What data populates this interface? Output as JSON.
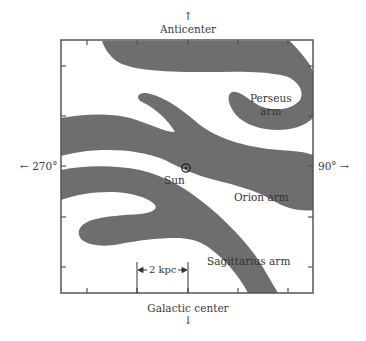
{
  "diagram": {
    "directions": {
      "top": {
        "arrow": "↑",
        "label": "Anticenter"
      },
      "bottom": {
        "label": "Galactic center",
        "arrow": "↓"
      },
      "left": {
        "label": "← 270°"
      },
      "right": {
        "label": "90° →"
      }
    },
    "arms": [
      {
        "name": "Perseus arm",
        "label_line1": "Perseus",
        "label_line2": "arm"
      },
      {
        "name": "Orion arm",
        "label": "Orion arm"
      },
      {
        "name": "Sagittarius arm",
        "label": "Sagittarius arm"
      }
    ],
    "sun": {
      "label": "Sun",
      "symbol": "⊙"
    },
    "scale_bar": {
      "label": "2 kpc"
    },
    "colors": {
      "arm_fill": "#6e6e6e",
      "frame": "#555555",
      "background": "#ffffff"
    }
  }
}
